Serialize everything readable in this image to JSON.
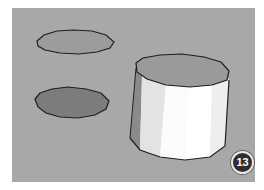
{
  "canvas": {
    "background": "#a8a8a8",
    "shapes": [
      {
        "name": "polygon-face-light",
        "fill": "#9c9c9c"
      },
      {
        "name": "polygon-face-dark",
        "fill": "#7c7c7c"
      },
      {
        "name": "extruded-cylinder",
        "top_fill": "#9a9a9a",
        "side_fill": "#f4f4f4"
      }
    ]
  },
  "step_badge": {
    "number": "13"
  }
}
